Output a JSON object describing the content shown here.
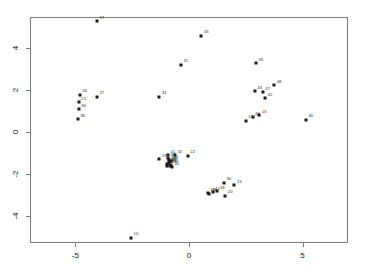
{
  "chart_data": {
    "type": "scatter",
    "title": "",
    "xlabel": "",
    "ylabel": "",
    "xlim": [
      -7.0,
      7.0
    ],
    "ylim": [
      -5.3,
      5.5
    ],
    "grid": false,
    "legend": null,
    "xticks": [
      -5,
      0,
      5
    ],
    "xtick_labels": [
      "-5",
      "0",
      "5"
    ],
    "yticks": [
      -4,
      -2,
      0,
      2,
      4
    ],
    "ytick_labels": [
      "-4",
      "-2",
      "0",
      "2",
      "4"
    ],
    "marker": "filled-square",
    "marker_color": "#1a1a1a",
    "points": [
      {
        "label": "17",
        "x": -4.05,
        "y": 5.3
      },
      {
        "label": "33",
        "x": 0.55,
        "y": 4.6
      },
      {
        "label": "11",
        "x": -0.35,
        "y": 3.22
      },
      {
        "label": "45",
        "x": 2.95,
        "y": 3.28
      },
      {
        "label": "48",
        "x": 3.75,
        "y": 2.25
      },
      {
        "label": "43",
        "x": 2.9,
        "y": 1.95
      },
      {
        "label": "47",
        "x": 3.25,
        "y": 1.9
      },
      {
        "label": "42",
        "x": 3.35,
        "y": 1.62
      },
      {
        "label": "20",
        "x": -4.8,
        "y": 1.78
      },
      {
        "label": "27",
        "x": -4.05,
        "y": 1.68
      },
      {
        "label": "21",
        "x": -4.85,
        "y": 1.42
      },
      {
        "label": "31",
        "x": -1.3,
        "y": 1.68
      },
      {
        "label": "36",
        "x": -4.85,
        "y": 1.08
      },
      {
        "label": "38",
        "x": -4.9,
        "y": 0.62
      },
      {
        "label": "15",
        "x": 3.1,
        "y": 0.8
      },
      {
        "label": "44",
        "x": 2.8,
        "y": 0.72
      },
      {
        "label": "14",
        "x": 2.5,
        "y": 0.55
      },
      {
        "label": "46",
        "x": 5.15,
        "y": 0.58
      },
      {
        "label": "41",
        "x": -0.92,
        "y": -1.1
      },
      {
        "label": "32",
        "x": -0.62,
        "y": -1.1
      },
      {
        "label": "23",
        "x": -1.3,
        "y": -1.3
      },
      {
        "label": "25",
        "x": -0.88,
        "y": -1.45
      },
      {
        "label": "24",
        "x": -0.95,
        "y": -1.52
      },
      {
        "label": "26",
        "x": -0.85,
        "y": -1.6
      },
      {
        "label": "28",
        "x": -0.8,
        "y": -1.4
      },
      {
        "label": "29",
        "x": -0.9,
        "y": -1.35
      },
      {
        "label": "34",
        "x": -0.98,
        "y": -1.62
      },
      {
        "label": "35",
        "x": -0.78,
        "y": -1.55
      },
      {
        "label": "37",
        "x": -0.86,
        "y": -1.48
      },
      {
        "label": "39",
        "x": -0.92,
        "y": -1.25
      },
      {
        "label": "40",
        "x": -0.75,
        "y": -1.68
      },
      {
        "label": "22",
        "x": -0.05,
        "y": -1.12
      },
      {
        "label": "30",
        "x": 1.55,
        "y": -2.42
      },
      {
        "label": "13",
        "x": 2.0,
        "y": -2.55
      },
      {
        "label": "12",
        "x": 1.05,
        "y": -2.88
      },
      {
        "label": "18",
        "x": 1.25,
        "y": -2.82
      },
      {
        "label": "19",
        "x": 0.82,
        "y": -2.92
      },
      {
        "label": "16",
        "x": 0.9,
        "y": -2.95
      },
      {
        "label": "20b",
        "x": 1.6,
        "y": -3.05
      },
      {
        "label": "10",
        "x": -2.55,
        "y": -5.05
      }
    ]
  }
}
